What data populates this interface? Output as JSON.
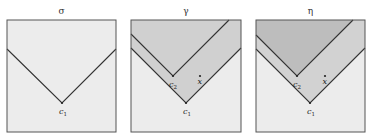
{
  "panels": [
    {
      "title": "σ",
      "labels": {
        "c1": "c",
        "c1_sub": "1"
      },
      "fill_colors": {
        "light": "#ececec"
      }
    },
    {
      "title": "γ",
      "labels": {
        "c1": "c",
        "c1_sub": "1",
        "c2": "c",
        "c2_sub": "2",
        "x": "x"
      },
      "fill_colors": {
        "light": "#ececec",
        "shaded": "#d0d0d0"
      }
    },
    {
      "title": "η",
      "labels": {
        "c1": "c",
        "c1_sub": "1",
        "c2": "c",
        "c2_sub": "2",
        "x": "x"
      },
      "fill_colors": {
        "light": "#ececec",
        "medium": "#d2d2d2",
        "dark": "#bdbdbd"
      }
    }
  ],
  "colors": {
    "border": "#555555",
    "line": "#333333"
  }
}
